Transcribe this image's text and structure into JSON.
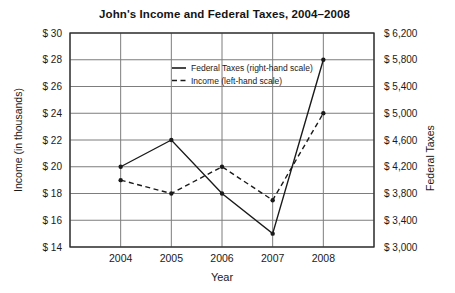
{
  "chart_data": {
    "type": "line",
    "title": "John's Income and Federal Taxes, 2004–2008",
    "x": [
      2004,
      2005,
      2006,
      2007,
      2008
    ],
    "xlabel": "Year",
    "left_axis": {
      "label": "Income (in thousands)",
      "min": 14,
      "max": 30,
      "step": 2,
      "tick_prefix": "$ ",
      "tick_labels": [
        "$ 14",
        "$ 16",
        "$ 18",
        "$ 20",
        "$ 22",
        "$ 24",
        "$ 26",
        "$ 28",
        "$ 30"
      ]
    },
    "right_axis": {
      "label": "Federal Taxes",
      "min": 3000,
      "max": 6200,
      "step": 400,
      "tick_prefix": "$ ",
      "tick_labels": [
        "$ 3,000",
        "$ 3,400",
        "$ 3,800",
        "$ 4,200",
        "$ 4,600",
        "$ 5,000",
        "$ 5,400",
        "$ 5,800",
        "$ 6,200"
      ]
    },
    "series": [
      {
        "name": "Federal Taxes (right-hand scale)",
        "axis": "right",
        "style": "solid",
        "values": [
          4200,
          4600,
          3800,
          3200,
          5800
        ]
      },
      {
        "name": "Income (left-hand scale)",
        "axis": "left",
        "style": "dashed",
        "values": [
          19,
          18,
          20,
          17.5,
          24
        ]
      }
    ],
    "legend": {
      "position": "inside-top-center",
      "entries": [
        "Federal Taxes (right-hand scale)",
        "Income (left-hand scale)"
      ]
    },
    "grid": "on",
    "colors": {
      "line": "#1a1a1a",
      "grid": "#7d7d7d",
      "border": "#2b2b2b",
      "text": "#1a1a1a",
      "background": "#ffffff"
    }
  }
}
